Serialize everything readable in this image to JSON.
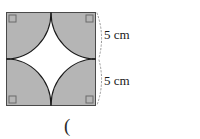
{
  "figure": {
    "kind": "square-with-four-quarter-circle-arcs",
    "square": {
      "x": 6,
      "y": 12,
      "width": 90,
      "height": 94,
      "fill_color": "#b5b5b5",
      "stroke_color": "#4a4a4a"
    },
    "arcs": {
      "count": 4,
      "stroke_color": "#1a1a1a",
      "inner_fill_color": "#ffffff",
      "radius": 45
    },
    "right_angle_markers": {
      "count": 4,
      "size": 7,
      "stroke_color": "#6b6b6b",
      "positions": [
        "top-left",
        "top-right",
        "bottom-left",
        "bottom-right"
      ]
    },
    "dimension_braces": {
      "style": "dotted-arc",
      "color": "#9a9a9a",
      "count": 2
    }
  },
  "labels": {
    "top_dimension": "5 cm",
    "bottom_dimension": "5 cm",
    "trailing_text": "("
  },
  "colors": {
    "shade": "#b5b5b5",
    "outline": "#4a4a4a",
    "arc": "#1a1a1a",
    "text": "#1a1a1a",
    "brace": "#9a9a9a",
    "background": "#ffffff"
  }
}
